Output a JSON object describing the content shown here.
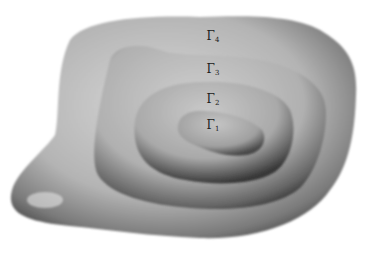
{
  "figure": {
    "colors": {
      "background": "#ffffff",
      "outer_light": "#d4d4d4",
      "outer_mid": "#a8a8a8",
      "shadow": "#3a3a3a",
      "terrace_fill": "#bdbdbd"
    },
    "levels": [
      {
        "id": "gamma1",
        "symbol": "Γ",
        "index": "1",
        "x": 213,
        "y": 125
      },
      {
        "id": "gamma2",
        "symbol": "Γ",
        "index": "2",
        "x": 213,
        "y": 99
      },
      {
        "id": "gamma3",
        "symbol": "Γ",
        "index": "3",
        "x": 213,
        "y": 69
      },
      {
        "id": "gamma4",
        "symbol": "Γ",
        "index": "4",
        "x": 213,
        "y": 36
      }
    ]
  }
}
